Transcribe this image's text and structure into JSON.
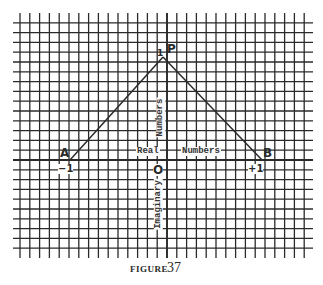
{
  "figure": {
    "caption_word": "FIGURE",
    "caption_number": "37"
  },
  "points": {
    "A": {
      "label": "A",
      "value_label": "−1"
    },
    "B": {
      "label": "B",
      "value_label": "+1"
    },
    "P": {
      "label": "P",
      "value_label": "1"
    },
    "O": {
      "label": "O"
    }
  },
  "axes": {
    "real_word_1": "Real",
    "real_word_2": "Numbers",
    "imag_word_upper": "Numbers",
    "imag_word_lower": "Imaginary"
  },
  "colors": {
    "ink": "#2a2a2a",
    "paper": "#ffffff"
  },
  "chart_data": {
    "type": "diagram",
    "title": "FIGURE 37",
    "points": [
      {
        "name": "A",
        "x": -1,
        "y": 0
      },
      {
        "name": "O",
        "x": 0,
        "y": 0
      },
      {
        "name": "B",
        "x": 1,
        "y": 0
      },
      {
        "name": "P",
        "x": 0,
        "y": 1
      }
    ],
    "segments": [
      [
        "A",
        "P"
      ],
      [
        "P",
        "B"
      ]
    ],
    "xlabel": "Real Numbers",
    "ylabel": "Imaginary Numbers",
    "grid": true
  }
}
